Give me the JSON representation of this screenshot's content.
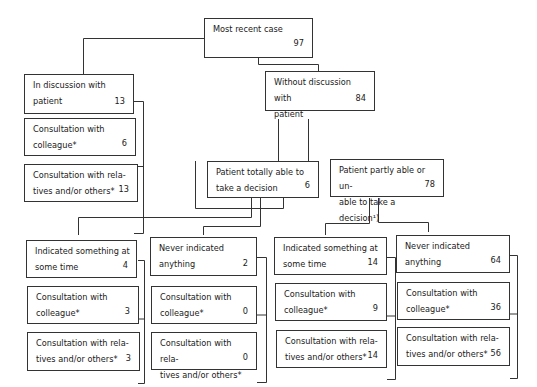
{
  "diagram": {
    "root": {
      "label": "Most recent case",
      "value": "97"
    },
    "level1": [
      {
        "label": "In discussion with\npatient",
        "value": "13",
        "subs": [
          {
            "label": "Consultation with\ncolleague*",
            "value": "6"
          },
          {
            "label": "Consultation with rela-\ntives and/or others*",
            "value": "13"
          }
        ]
      },
      {
        "label": "Without discussion with\npatient",
        "value": "84"
      }
    ],
    "level2": [
      {
        "label": "Patient totally able to\ntake a decision",
        "value": "6"
      },
      {
        "label": "Patient partly able or un-\nable to take a decision¹)",
        "value": "78"
      }
    ],
    "level3": [
      {
        "label": "Indicated something at\nsome time",
        "value": "4",
        "subs": [
          {
            "label": "Consultation with\ncolleague*",
            "value": "3"
          },
          {
            "label": "Consultation with rela-\ntives and/or others*",
            "value": "3"
          }
        ]
      },
      {
        "label": "Never indicated\nanything",
        "value": "2",
        "subs": [
          {
            "label": "Consultation with\ncolleague*",
            "value": "0"
          },
          {
            "label": "Consultation with rela-\ntives and/or others*",
            "value": "0"
          }
        ]
      },
      {
        "label": "Indicated something at\nsome time",
        "value": "14",
        "subs": [
          {
            "label": "Consultation with\ncolleague*",
            "value": "9"
          },
          {
            "label": "Consultation with rela-\ntives and/or others*",
            "value": "14"
          }
        ]
      },
      {
        "label": "Never indicated\nanything",
        "value": "64",
        "subs": [
          {
            "label": "Consultation with\ncolleague*",
            "value": "36"
          },
          {
            "label": "Consultation with rela-\ntives and/or others*",
            "value": "56"
          }
        ]
      }
    ]
  }
}
